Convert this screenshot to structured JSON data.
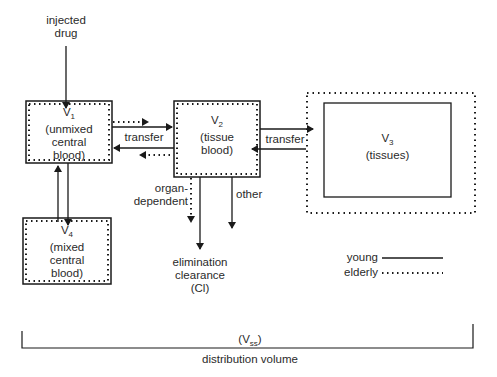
{
  "diagram": {
    "input": {
      "line1": "injected",
      "line2": "drug"
    },
    "compartments": {
      "v1": {
        "symbol": "V",
        "sub": "1",
        "line1": "(unmixed",
        "line2": "central",
        "line3": "blood)"
      },
      "v2": {
        "symbol": "V",
        "sub": "2",
        "line1": "(tissue",
        "line2": "blood)"
      },
      "v3": {
        "symbol": "V",
        "sub": "3",
        "line1": "(tissues)"
      },
      "v4": {
        "symbol": "V",
        "sub": "4",
        "line1": "(mixed",
        "line2": "central",
        "line3": "blood)"
      }
    },
    "flows": {
      "transfer_v1_v2": "transfer",
      "transfer_v2_v3": "transfer",
      "organ_dependent_line1": "organ-",
      "organ_dependent_line2": "dependent",
      "other": "other"
    },
    "elimination": {
      "line1": "elimination",
      "line2": "clearance",
      "line3": "(Cl)"
    },
    "legend": {
      "young": "young",
      "elderly": "elderly"
    },
    "distribution": {
      "symbol": "(V",
      "sub": "ss",
      "close": ")",
      "label": "distribution volume"
    },
    "colors": {
      "line": "#1a1a1a",
      "text": "#2a2a2a"
    }
  }
}
